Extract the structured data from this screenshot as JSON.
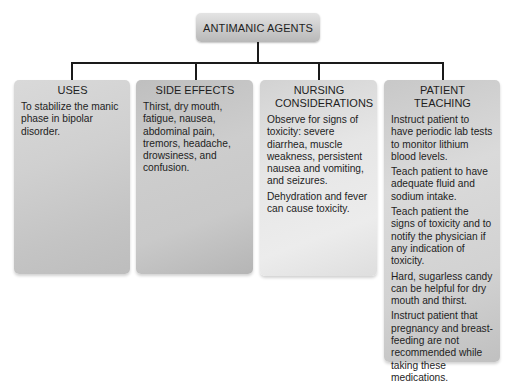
{
  "diagram": {
    "title": "ANTIMANIC AGENTS",
    "colors": {
      "connector": "#1a1a1a",
      "box_gray": "#c9c9c9"
    },
    "boxes": [
      {
        "heading": "USES",
        "paragraphs": [
          "To stabilize the manic phase in bipolar disorder."
        ]
      },
      {
        "heading": "SIDE EFFECTS",
        "paragraphs": [
          "Thirst, dry mouth, fatigue, nausea, abdominal pain, tremors, headache, drowsiness, and confusion."
        ]
      },
      {
        "heading": "NURSING CONSIDERATIONS",
        "paragraphs": [
          "Observe for signs of toxicity: severe diarrhea, muscle weakness, persistent nausea and vomiting, and seizures.",
          "Dehydration and fever can cause toxicity."
        ]
      },
      {
        "heading": "PATIENT TEACHING",
        "paragraphs": [
          "Instruct patient to have periodic lab tests to monitor lithium blood levels.",
          "Teach patient to have adequate fluid and sodium intake.",
          "Teach patient the signs of toxicity and to notify the physician if any indication of toxicity.",
          "Hard, sugarless candy can be helpful for dry mouth and thirst.",
          "Instruct patient that pregnancy and breast-feeding are not recommended while taking these medications."
        ]
      }
    ]
  }
}
